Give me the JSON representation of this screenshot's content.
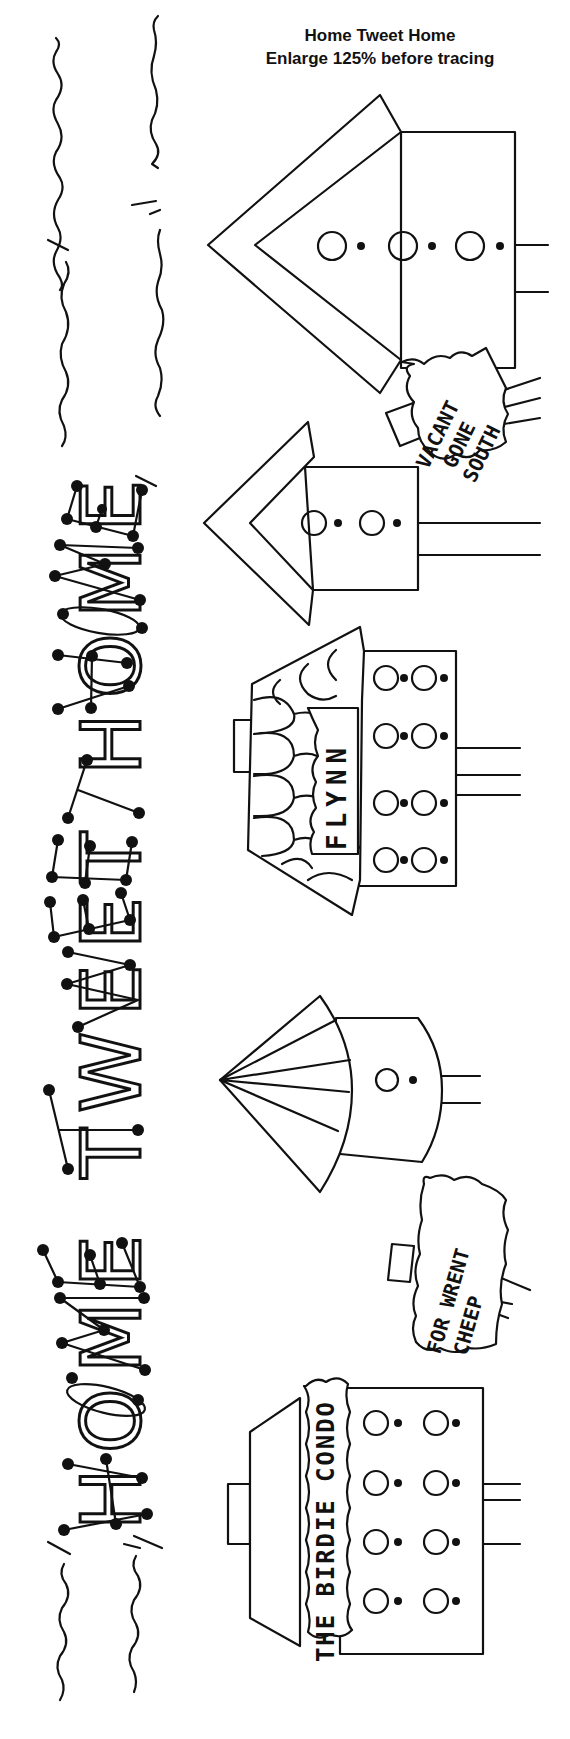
{
  "header": {
    "title": "Home Tweet Home",
    "subtitle": "Enlarge 125% before tracing"
  },
  "banner": {
    "text": "HOME TWEET HOME",
    "orientation": "vertical, reads bottom-to-top"
  },
  "houses": [
    {
      "id": "house-1",
      "style": "tall gable birdhouse",
      "holes": 3
    },
    {
      "id": "house-2",
      "style": "small gable birdhouse",
      "holes": 2
    },
    {
      "id": "house-3",
      "style": "shingled roof birdhouse",
      "holes": 8,
      "sign": "FLYNN"
    },
    {
      "id": "house-4",
      "style": "dome fan roof birdhouse",
      "holes": 1
    },
    {
      "id": "house-5",
      "style": "condo birdhouse",
      "holes": 8,
      "sign": "THE BIRDIE CONDO"
    }
  ],
  "signs": {
    "vacant": {
      "line1": "VACANT",
      "line2": "GONE",
      "line3": "SOUTH"
    },
    "flynn": {
      "text": "FLYNN"
    },
    "forwrent": {
      "line1": "FOR WRENT",
      "line2": "CHEEP"
    },
    "condo": {
      "text": "THE BIRDIE CONDO"
    }
  },
  "colors": {
    "ink": "#111111",
    "paper": "#ffffff"
  }
}
